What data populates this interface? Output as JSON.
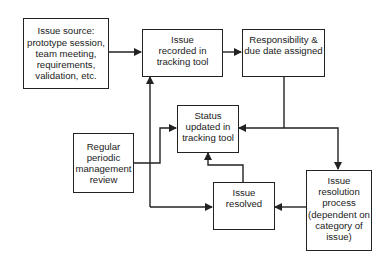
{
  "diagram": {
    "type": "flowchart",
    "nodes": [
      {
        "id": "issue_source",
        "label": "Issue source:\nprototype session,\nteam meeting,\nrequirements,\nvalidation, etc."
      },
      {
        "id": "issue_recorded",
        "label": "Issue\nrecorded in\ntracking tool"
      },
      {
        "id": "responsibility",
        "label": "Responsibility &\ndue date assigned"
      },
      {
        "id": "status_updated",
        "label": "Status\nupdated in\ntracking tool"
      },
      {
        "id": "periodic_review",
        "label": "Regular\nperiodic\nmanagement\nreview"
      },
      {
        "id": "issue_resolved",
        "label": "Issue\nresolved"
      },
      {
        "id": "resolution_process",
        "label": "Issue\nresolution\nprocess\n(dependent on\ncategory of\nissue)"
      }
    ],
    "edges": [
      {
        "from": "issue_source",
        "to": "issue_recorded"
      },
      {
        "from": "issue_recorded",
        "to": "responsibility"
      },
      {
        "from": "responsibility",
        "to": "status_updated"
      },
      {
        "from": "responsibility",
        "to": "resolution_process"
      },
      {
        "from": "resolution_process",
        "to": "issue_resolved"
      },
      {
        "from": "issue_resolved",
        "to": "status_updated"
      },
      {
        "from": "issue_resolved",
        "to": "issue_recorded"
      },
      {
        "from": "periodic_review",
        "to": "status_updated"
      },
      {
        "from": "periodic_review",
        "to": "issue_resolved"
      }
    ],
    "colors": {
      "stroke": "#222222",
      "background": "#ffffff"
    }
  }
}
